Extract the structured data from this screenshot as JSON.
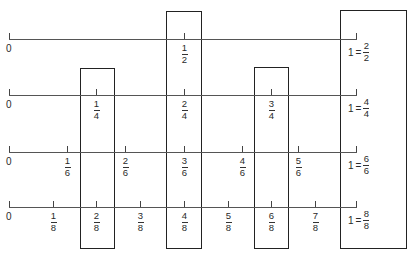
{
  "diagram": {
    "title": "",
    "number_lines": [
      {
        "id": "halves",
        "zero_label": "0",
        "ticks": [
          {
            "num": "1",
            "den": "2"
          }
        ],
        "end_label": {
          "whole": "1",
          "eq": "=",
          "num": "2",
          "den": "2"
        }
      },
      {
        "id": "fourths",
        "zero_label": "0",
        "ticks": [
          {
            "num": "1",
            "den": "4"
          },
          {
            "num": "2",
            "den": "4"
          },
          {
            "num": "3",
            "den": "4"
          }
        ],
        "end_label": {
          "whole": "1",
          "eq": "=",
          "num": "4",
          "den": "4"
        }
      },
      {
        "id": "sixths",
        "zero_label": "0",
        "ticks": [
          {
            "num": "1",
            "den": "6"
          },
          {
            "num": "2",
            "den": "6"
          },
          {
            "num": "3",
            "den": "6"
          },
          {
            "num": "4",
            "den": "6"
          },
          {
            "num": "5",
            "den": "6"
          }
        ],
        "end_label": {
          "whole": "1",
          "eq": "=",
          "num": "6",
          "den": "6"
        }
      },
      {
        "id": "eighths",
        "zero_label": "0",
        "ticks": [
          {
            "num": "1",
            "den": "8"
          },
          {
            "num": "2",
            "den": "8"
          },
          {
            "num": "3",
            "den": "8"
          },
          {
            "num": "4",
            "den": "8"
          },
          {
            "num": "5",
            "den": "8"
          },
          {
            "num": "6",
            "den": "8"
          },
          {
            "num": "7",
            "den": "8"
          }
        ],
        "end_label": {
          "whole": "1",
          "eq": "=",
          "num": "8",
          "den": "8"
        }
      }
    ],
    "highlight_boxes": [
      {
        "id": "one-quarter",
        "groups": [
          "1/4",
          "2/8"
        ]
      },
      {
        "id": "one-half",
        "groups": [
          "1/2",
          "2/4",
          "3/6",
          "4/8"
        ]
      },
      {
        "id": "three-quarters",
        "groups": [
          "3/4",
          "6/8"
        ]
      },
      {
        "id": "whole",
        "groups": [
          "2/2",
          "4/4",
          "6/6",
          "8/8"
        ]
      }
    ]
  }
}
